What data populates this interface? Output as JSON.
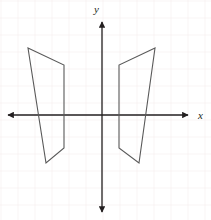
{
  "figure": {
    "width": 211,
    "height": 220,
    "background_color": "#ffffff"
  },
  "grid": {
    "visible": true,
    "spacing_px": 17,
    "color": "#f2eaea",
    "line_width": 0.8
  },
  "axes": {
    "color": "#231f20",
    "line_width": 1.3,
    "origin": {
      "x": 102,
      "y": 115
    },
    "x_axis": {
      "label": "x",
      "label_x": 202,
      "label_y": 119,
      "start_x": 8,
      "end_x": 188,
      "y": 115,
      "arrows": "both"
    },
    "y_axis": {
      "label": "y",
      "label_x": 97,
      "label_y": 13,
      "start_y": 22,
      "end_y": 212,
      "x": 102,
      "arrows": "both"
    }
  },
  "shapes": [
    {
      "name": "left-quadrilateral",
      "stroke": "#595959",
      "stroke_width": 1.1,
      "fill": "none",
      "points_px": "28,48 64,65 64,148 46,163",
      "vertices": [
        {
          "px_x": 28,
          "px_y": 48
        },
        {
          "px_x": 64,
          "px_y": 65
        },
        {
          "px_x": 64,
          "px_y": 148
        },
        {
          "px_x": 46,
          "px_y": 163
        }
      ]
    },
    {
      "name": "right-quadrilateral",
      "stroke": "#595959",
      "stroke_width": 1.1,
      "fill": "none",
      "points_px": "155,48 119,65 119,148 139,163",
      "vertices": [
        {
          "px_x": 155,
          "px_y": 48
        },
        {
          "px_x": 119,
          "px_y": 65
        },
        {
          "px_x": 119,
          "px_y": 148
        },
        {
          "px_x": 139,
          "px_y": 163
        }
      ]
    }
  ]
}
